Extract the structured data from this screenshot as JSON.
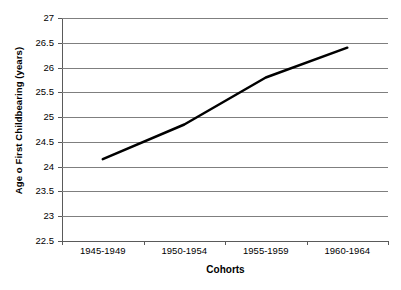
{
  "chart_data": {
    "type": "line",
    "title": "",
    "xlabel": "Cohorts",
    "ylabel": "Age o First Childbearing (years)",
    "categories": [
      "1945-1949",
      "1950-1954",
      "1955-1959",
      "1960-1964"
    ],
    "series": [
      {
        "name": "Age at first childbearing",
        "values": [
          24.15,
          24.85,
          25.8,
          26.4
        ],
        "color": "#000000",
        "line_width": 2.5,
        "markers": false
      }
    ],
    "ylim": [
      22.5,
      27
    ],
    "ytick_step": 0.5,
    "yticks": [
      "27",
      "26.5",
      "26",
      "25.5",
      "25",
      "24.5",
      "24",
      "23.5",
      "23",
      "22.5"
    ],
    "ytick_values": [
      27,
      26.5,
      26,
      25.5,
      25,
      24.5,
      24,
      23.5,
      23,
      22.5
    ],
    "grid": true,
    "grid_axis": "y",
    "grid_color": "#7f7f7f",
    "axis_color": "#5a5a5a",
    "background": "#ffffff",
    "legend": false,
    "legend_position": "none"
  }
}
